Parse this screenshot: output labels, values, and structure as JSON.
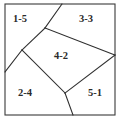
{
  "figure": {
    "background_color": "#ffffff",
    "frame_color": "#3a3a3a",
    "line_color": "#2e2e2e",
    "label_color": "#2b2b2b",
    "frame": {
      "x": 5,
      "y": 4,
      "width": 110,
      "height": 111
    },
    "cut_lines": [
      {
        "name": "cut-top-left-diagonal",
        "x1": 62,
        "y1": 4,
        "x2": 45,
        "y2": 28
      },
      {
        "name": "cut-upper-left-to-edge",
        "x1": 45,
        "y1": 28,
        "x2": 22,
        "y2": 50
      },
      {
        "name": "cut-left-edge-descend",
        "x1": 22,
        "y1": 50,
        "x2": 5,
        "y2": 72
      },
      {
        "name": "cut-upper-right-to-right-edge",
        "x1": 45,
        "y1": 28,
        "x2": 115,
        "y2": 55
      },
      {
        "name": "cut-right-edge-to-center-bottom",
        "x1": 115,
        "y1": 55,
        "x2": 65,
        "y2": 93
      },
      {
        "name": "cut-center-bottom-to-left-vertex",
        "x1": 65,
        "y1": 93,
        "x2": 22,
        "y2": 50
      },
      {
        "name": "cut-center-bottom-to-bottom-edge",
        "x1": 65,
        "y1": 93,
        "x2": 73,
        "y2": 115
      }
    ],
    "regions": [
      {
        "name": "region-top-left",
        "label": "1-5",
        "cx": 20,
        "cy": 20
      },
      {
        "name": "region-top-right",
        "label": "3-3",
        "cx": 86,
        "cy": 20
      },
      {
        "name": "region-center",
        "label": "4-2",
        "cx": 61,
        "cy": 57
      },
      {
        "name": "region-bottom-left",
        "label": "2-4",
        "cx": 25,
        "cy": 94
      },
      {
        "name": "region-bottom-right",
        "label": "5-1",
        "cx": 95,
        "cy": 94
      }
    ],
    "caption": ""
  }
}
